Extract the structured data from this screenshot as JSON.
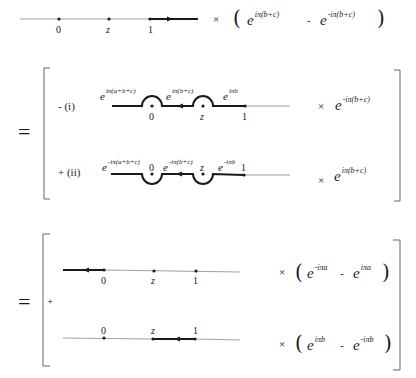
{
  "diagram": {
    "points": {
      "zero": "0",
      "z": "z",
      "one": "1"
    },
    "row0": {
      "multiplier": "×",
      "term1_base": "e",
      "term1_exp": "iπ(b+c)",
      "minus": "-",
      "term2_base": "e",
      "term2_exp": "-iπ(b+c)"
    },
    "equals_1": "=",
    "block1": {
      "row_i": {
        "sign_label": "- (i)",
        "phase_left_base": "e",
        "phase_left_exp": "iπ(a+b+c)",
        "phase_mid_base": "e",
        "phase_mid_exp": "iπ(b+c)",
        "phase_right_base": "e",
        "phase_right_exp": "iπb",
        "multiplier": "×",
        "factor_base": "e",
        "factor_exp": "-iπ(b+c)"
      },
      "row_ii": {
        "sign_label": "+ (ii)",
        "phase_left_base": "e",
        "phase_left_exp": "-iπ(a+b+c)",
        "phase_mid_base": "e",
        "phase_mid_exp": "-iπ(b+c)",
        "phase_right_base": "e",
        "phase_right_exp": "-iπb",
        "multiplier": "×",
        "factor_base": "e",
        "factor_exp": "iπ(b+c)"
      }
    },
    "equals_2": "=",
    "block2": {
      "plus": "+",
      "row_a": {
        "multiplier": "×",
        "term1_base": "e",
        "term1_exp": "-iπa",
        "minus": "-",
        "term2_base": "e",
        "term2_exp": "iπa"
      },
      "row_b": {
        "multiplier": "×",
        "term1_base": "e",
        "term1_exp": "iπb",
        "minus": "-",
        "term2_base": "e",
        "term2_exp": "-iπb"
      }
    },
    "colors": {
      "ink": "#1a1a1a",
      "thin_line": "#888888",
      "bracket": "#666666"
    }
  }
}
